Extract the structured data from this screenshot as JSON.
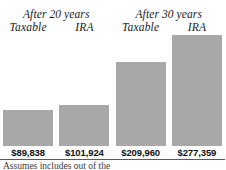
{
  "chart_data": {
    "type": "bar",
    "title": "",
    "subtitle": "",
    "xlabel": "",
    "ylabel": "",
    "grid": false,
    "legend_position": "none",
    "group_headers": [
      "After 20 years",
      "After 30 years"
    ],
    "categories": [
      "Taxable",
      "IRA",
      "Taxable",
      "IRA"
    ],
    "values": [
      89838,
      101924,
      209960,
      277359
    ],
    "value_labels": [
      "$89,838",
      "$101,924",
      "$209,960",
      "$277,359"
    ],
    "ylim": [
      0,
      277359
    ],
    "bar_color": "#a8a8a8",
    "background_color": "#ffffff",
    "text_color": "#1a1a1a",
    "bars": [
      {
        "group": "After 20 years",
        "category": "Taxable",
        "value": 89838,
        "label": "$89,838"
      },
      {
        "group": "After 20 years",
        "category": "IRA",
        "value": 101924,
        "label": "$101,924"
      },
      {
        "group": "After 30 years",
        "category": "Taxable",
        "value": 209960,
        "label": "$209,960"
      },
      {
        "group": "After 30 years",
        "category": "IRA",
        "value": 277359,
        "label": "$277,359"
      }
    ]
  },
  "footnote": {
    "text": "Assumes includes out of the"
  }
}
